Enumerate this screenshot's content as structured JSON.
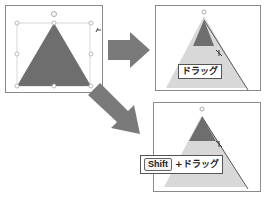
{
  "steps": [
    {
      "id": "original",
      "description": "Selected triangle shape with handles"
    },
    {
      "id": "drag",
      "label": "ドラッグ"
    },
    {
      "id": "shift-drag",
      "key": "Shift",
      "label": "+ドラッグ"
    }
  ],
  "colors": {
    "shape_fill": "#6e6e6e",
    "ghost_fill": "#d8d8d8",
    "arrow_fill": "#7a7a7a",
    "panel_border": "#8a8a8a"
  }
}
